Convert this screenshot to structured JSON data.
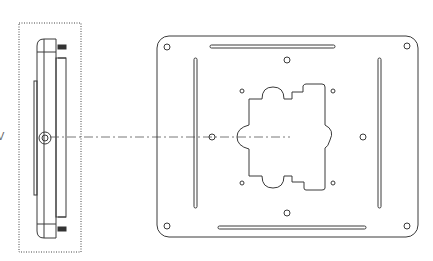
{
  "figure": {
    "type": "technical-drawing",
    "views": [
      {
        "name": "side-view",
        "description": "Side profile of mounting bracket enclosed in dotted detail box"
      },
      {
        "name": "front-view",
        "description": "Front view of rectangular mounting plate with slots, holes and central cutout"
      }
    ],
    "partial_label": "V",
    "colors": {
      "line": "#3a3a3a",
      "background": "#ffffff"
    }
  }
}
